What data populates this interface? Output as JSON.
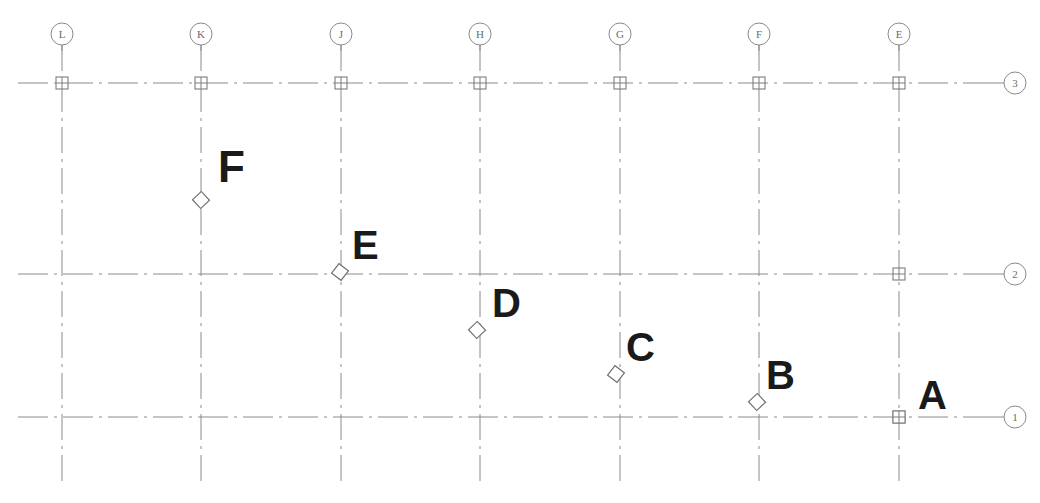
{
  "drawing": {
    "type": "structural-column-grid-plan",
    "title": "",
    "canvas": {
      "width": 1040,
      "height": 503
    },
    "line_color": "#8a8a8a",
    "label_color": "#1a1a1a",
    "bubble_color": "#8a8a8a"
  },
  "column_grids": {
    "axis": "vertical",
    "bubble_radius": 11,
    "bubble_y": 34,
    "line_top": 45,
    "line_bottom": 487,
    "items": [
      {
        "label": "L",
        "x": 62
      },
      {
        "label": "K",
        "x": 201
      },
      {
        "label": "J",
        "x": 341
      },
      {
        "label": "H",
        "x": 480
      },
      {
        "label": "G",
        "x": 620
      },
      {
        "label": "F",
        "x": 759
      },
      {
        "label": "E",
        "x": 899
      }
    ]
  },
  "row_grids": {
    "axis": "horizontal",
    "bubble_radius": 11,
    "bubble_x": 1015,
    "line_left": 18,
    "line_right": 975,
    "items": [
      {
        "label": "3",
        "y": 83
      },
      {
        "label": "2",
        "y": 274
      },
      {
        "label": "1",
        "y": 417
      }
    ]
  },
  "grid_intersection_nodes": [
    {
      "grid": "L-3",
      "x": 62,
      "y": 83
    },
    {
      "grid": "K-3",
      "x": 201,
      "y": 83
    },
    {
      "grid": "J-3",
      "x": 341,
      "y": 83
    },
    {
      "grid": "H-3",
      "x": 480,
      "y": 83
    },
    {
      "grid": "G-3",
      "x": 620,
      "y": 83
    },
    {
      "grid": "F-3",
      "x": 759,
      "y": 83
    },
    {
      "grid": "E-3",
      "x": 899,
      "y": 83
    },
    {
      "grid": "E-2",
      "x": 899,
      "y": 274
    },
    {
      "grid": "E-1",
      "x": 899,
      "y": 417
    }
  ],
  "points": [
    {
      "label": "A",
      "marker": "crossed-square",
      "x": 899,
      "y": 417,
      "label_x": 918,
      "label_y": 375,
      "label_size": 40,
      "on_grid": "E-1"
    },
    {
      "label": "B",
      "marker": "diamond",
      "x": 757,
      "y": 402,
      "label_x": 766,
      "label_y": 355,
      "label_size": 40,
      "on_grid": "F"
    },
    {
      "label": "C",
      "marker": "diamond",
      "x": 616,
      "y": 374,
      "label_x": 626,
      "label_y": 327,
      "label_size": 40,
      "on_grid": "G"
    },
    {
      "label": "D",
      "marker": "diamond",
      "x": 477,
      "y": 330,
      "label_x": 492,
      "label_y": 283,
      "label_size": 40,
      "on_grid": "H"
    },
    {
      "label": "E",
      "marker": "diamond",
      "x": 340,
      "y": 272,
      "label_x": 352,
      "label_y": 225,
      "label_size": 40,
      "on_grid": "J-2"
    },
    {
      "label": "F",
      "marker": "diamond",
      "x": 201,
      "y": 200,
      "label_x": 218,
      "label_y": 145,
      "label_size": 44,
      "on_grid": "K"
    }
  ]
}
